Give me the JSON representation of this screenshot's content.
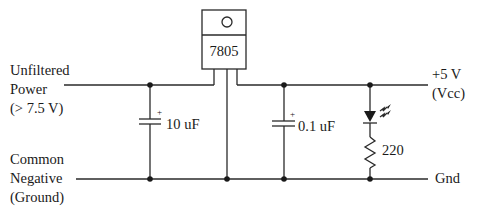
{
  "regulator": {
    "part": "7805",
    "icon": "mounting-hole-circle"
  },
  "inputs": {
    "power_label_lines": [
      "Unfiltered",
      "Power",
      "(> 7.5 V)"
    ],
    "ground_label_lines": [
      "Common",
      "Negative",
      "(Ground)"
    ]
  },
  "outputs": {
    "vcc_label_lines": [
      "+5 V",
      "(Vcc)"
    ],
    "gnd_label": "Gnd"
  },
  "components": {
    "input_capacitor": {
      "value": "10 uF",
      "polarity": "+"
    },
    "output_capacitor": {
      "value": "0.1 uF",
      "polarity": "+"
    },
    "led": {
      "icon": "led-icon"
    },
    "resistor": {
      "value": "220"
    }
  },
  "colors": {
    "line": "#2a2a2a",
    "background": "#ffffff"
  }
}
